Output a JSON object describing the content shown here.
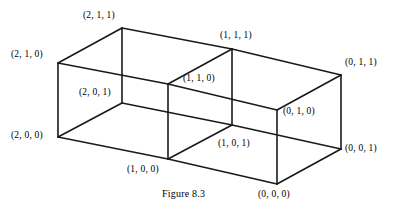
{
  "figure": {
    "caption": "Figure 8.3",
    "caption_pos": {
      "x": 162,
      "y": 188
    },
    "type": "3d-lattice-diagram",
    "stroke_color": "#1a1a1a",
    "background_color": "#ffffff",
    "stroke_width": 1.6,
    "projection": {
      "origin": {
        "x": 277,
        "y": 184
      },
      "x_axis_step": {
        "dx": -74.5,
        "dy": -11.5
      },
      "y_axis_step": {
        "dx": 0,
        "dy": -74
      },
      "z_axis_step": {
        "dx": 63.5,
        "dy": -34.5
      }
    },
    "vertices": [
      {
        "id": "v211",
        "label": "(2, 1, 1)",
        "x": 122,
        "y": 28,
        "lx": 83,
        "ly": 10,
        "anchor": "above"
      },
      {
        "id": "v210",
        "label": "(2, 1, 0)",
        "x": 58,
        "y": 63,
        "lx": 11,
        "ly": 49,
        "anchor": "left"
      },
      {
        "id": "v201",
        "label": "(2, 0, 1)",
        "x": 122,
        "y": 103,
        "lx": 79,
        "ly": 87,
        "anchor": "left-above"
      },
      {
        "id": "v200",
        "label": "(2, 0, 0)",
        "x": 58,
        "y": 137,
        "lx": 11,
        "ly": 130,
        "anchor": "left"
      },
      {
        "id": "v111",
        "label": "(1, 1, 1)",
        "x": 232,
        "y": 49,
        "lx": 220,
        "ly": 30,
        "anchor": "above"
      },
      {
        "id": "v110",
        "label": "(1, 1, 0)",
        "x": 168,
        "y": 84,
        "lx": 183,
        "ly": 73,
        "anchor": "right"
      },
      {
        "id": "v101",
        "label": "(1, 0, 1)",
        "x": 232,
        "y": 125,
        "lx": 218,
        "ly": 138,
        "anchor": "below-right"
      },
      {
        "id": "v100",
        "label": "(1, 0, 0)",
        "x": 168,
        "y": 159,
        "lx": 127,
        "ly": 164,
        "anchor": "below-left"
      },
      {
        "id": "v011",
        "label": "(0, 1, 1)",
        "x": 341,
        "y": 75,
        "lx": 345,
        "ly": 57,
        "anchor": "right"
      },
      {
        "id": "v010",
        "label": "(0, 1, 0)",
        "x": 277,
        "y": 110,
        "lx": 283,
        "ly": 106,
        "anchor": "right"
      },
      {
        "id": "v001",
        "label": "(0, 0, 1)",
        "x": 341,
        "y": 149,
        "lx": 345,
        "ly": 143,
        "anchor": "right"
      },
      {
        "id": "v000",
        "label": "(0, 0, 0)",
        "x": 277,
        "y": 184,
        "lx": 258,
        "ly": 189,
        "anchor": "below"
      }
    ],
    "edges": [
      [
        "v211",
        "v111"
      ],
      [
        "v111",
        "v011"
      ],
      [
        "v211",
        "v210"
      ],
      [
        "v111",
        "v110"
      ],
      [
        "v011",
        "v010"
      ],
      [
        "v210",
        "v110"
      ],
      [
        "v110",
        "v010"
      ],
      [
        "v211",
        "v201"
      ],
      [
        "v111",
        "v101"
      ],
      [
        "v011",
        "v001"
      ],
      [
        "v210",
        "v200"
      ],
      [
        "v110",
        "v100"
      ],
      [
        "v010",
        "v000"
      ],
      [
        "v201",
        "v101"
      ],
      [
        "v101",
        "v001"
      ],
      [
        "v200",
        "v100"
      ],
      [
        "v100",
        "v000"
      ],
      [
        "v201",
        "v200"
      ],
      [
        "v101",
        "v100"
      ],
      [
        "v001",
        "v000"
      ]
    ]
  }
}
